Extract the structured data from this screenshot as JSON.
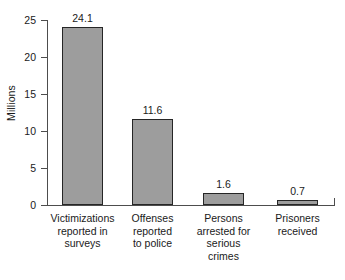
{
  "chart_data": {
    "type": "bar",
    "title": "",
    "subtitle": "",
    "xlabel": "",
    "ylabel": "Millions",
    "ylim": [
      0,
      25
    ],
    "yticks": [
      0,
      5,
      10,
      15,
      20,
      25
    ],
    "ytick_labels": [
      "0",
      "5",
      "10",
      "15",
      "20",
      "25"
    ],
    "grid": false,
    "legend": null,
    "categories": [
      "Victimizations reported in surveys",
      "Offenses reported to police",
      "Persons arrested for serious crimes",
      "Prisoners received"
    ],
    "category_lines": [
      [
        "Victimizations",
        "reported in",
        "surveys"
      ],
      [
        "Offenses",
        "reported",
        "to police"
      ],
      [
        "Persons",
        "arrested for",
        "serious",
        "crimes"
      ],
      [
        "Prisoners",
        "received"
      ]
    ],
    "values": [
      24.1,
      11.6,
      1.6,
      0.7
    ],
    "value_labels": [
      "24.1",
      "11.6",
      "1.6",
      "0.7"
    ],
    "bar_fill_color": "#9d9d9d",
    "bar_edge_color": "#262626",
    "axis_color": "#4d4d4d",
    "background_color": "#ffffff"
  }
}
